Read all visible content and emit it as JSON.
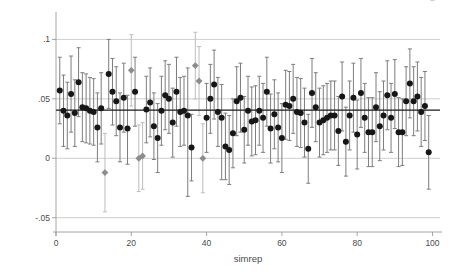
{
  "figure": {
    "background": "#ffffff",
    "plot_area": {
      "left": 56,
      "right": 440,
      "top": 18,
      "bottom": 232
    }
  },
  "chart_data": {
    "type": "scatter",
    "title": "",
    "subtitle": "",
    "xlabel": "simrep",
    "ylabel": "",
    "xlim": [
      0,
      102
    ],
    "ylim": [
      -0.062,
      0.118
    ],
    "xticks": [
      0,
      20,
      40,
      60,
      80,
      100
    ],
    "xtick_labels": [
      "0",
      "20",
      "40",
      "60",
      "80",
      "100"
    ],
    "yticks": [
      -0.05,
      0,
      0.05,
      0.1
    ],
    "ytick_labels": [
      "-.05",
      "0",
      ".05",
      ".1"
    ],
    "grid": {
      "horizontal": true,
      "vertical": false,
      "color": "#b9b9b9"
    },
    "legend": {
      "visible": false,
      "position": "none"
    },
    "reference_line": {
      "value": 0.0405,
      "color": "#1a1a1a",
      "width": 1.1,
      "label": ""
    },
    "marker_styles": {
      "normal": {
        "shape": "circle",
        "color": "#161616",
        "size": 3.0
      },
      "highlight": {
        "shape": "diamond",
        "color": "#8c8c8c",
        "size": 3.4
      }
    },
    "errorbar_style": {
      "color": "#7d7d7d",
      "highlight_color": "#bdbdbd",
      "width": 1.0,
      "cap_width": 4.0
    },
    "n_points": 100,
    "x": [
      1,
      2,
      3,
      4,
      5,
      6,
      7,
      8,
      9,
      10,
      11,
      12,
      13,
      14,
      15,
      16,
      17,
      18,
      19,
      20,
      21,
      22,
      23,
      24,
      25,
      26,
      27,
      28,
      29,
      30,
      31,
      32,
      33,
      34,
      35,
      36,
      37,
      38,
      39,
      40,
      41,
      42,
      43,
      44,
      45,
      46,
      47,
      48,
      49,
      50,
      51,
      52,
      53,
      54,
      55,
      56,
      57,
      58,
      59,
      60,
      61,
      62,
      63,
      64,
      65,
      66,
      67,
      68,
      69,
      70,
      71,
      72,
      73,
      74,
      75,
      76,
      77,
      78,
      79,
      80,
      81,
      82,
      83,
      84,
      85,
      86,
      87,
      88,
      89,
      90,
      91,
      92,
      93,
      94,
      95,
      96,
      97,
      98,
      99,
      100
    ],
    "y": [
      0.057,
      0.04,
      0.036,
      0.054,
      0.038,
      0.064,
      0.043,
      0.042,
      0.04,
      0.039,
      0.026,
      0.042,
      -0.012,
      0.071,
      0.056,
      0.048,
      0.026,
      0.051,
      0.025,
      0.074,
      0.056,
      0.0,
      0.002,
      0.041,
      0.047,
      0.027,
      0.017,
      0.04,
      0.053,
      0.05,
      0.03,
      0.056,
      0.039,
      0.04,
      0.036,
      0.009,
      0.078,
      0.065,
      0.0,
      0.034,
      0.05,
      0.062,
      0.039,
      0.034,
      0.01,
      0.007,
      0.021,
      0.048,
      0.051,
      0.024,
      0.04,
      0.031,
      0.032,
      0.04,
      0.034,
      0.056,
      0.025,
      0.037,
      0.026,
      0.017,
      0.045,
      0.044,
      0.05,
      0.039,
      0.038,
      0.03,
      0.008,
      0.055,
      0.043,
      0.03,
      0.032,
      0.034,
      0.036,
      0.036,
      0.023,
      0.052,
      0.014,
      0.036,
      0.051,
      0.02,
      0.055,
      0.034,
      0.022,
      0.022,
      0.043,
      0.027,
      0.036,
      0.053,
      0.034,
      0.054,
      0.022,
      0.022,
      0.048,
      0.063,
      0.048,
      0.052,
      0.039,
      0.044,
      0.005
    ],
    "y_low": [
      0.029,
      0.01,
      0.008,
      0.022,
      0.01,
      0.035,
      0.014,
      0.013,
      0.012,
      0.011,
      -0.003,
      0.012,
      -0.045,
      0.042,
      0.028,
      0.019,
      -0.003,
      0.022,
      -0.005,
      0.044,
      0.027,
      -0.028,
      -0.026,
      0.013,
      0.018,
      -0.001,
      -0.012,
      0.011,
      0.024,
      0.021,
      0.001,
      0.027,
      0.01,
      0.011,
      -0.032,
      -0.019,
      0.05,
      0.036,
      -0.029,
      0.005,
      0.021,
      0.033,
      0.01,
      -0.018,
      -0.018,
      -0.022,
      -0.008,
      0.019,
      0.022,
      -0.004,
      0.011,
      0.002,
      0.003,
      0.011,
      0.005,
      0.027,
      -0.004,
      0.008,
      -0.003,
      -0.012,
      0.016,
      0.015,
      0.021,
      0.01,
      0.009,
      0.001,
      -0.021,
      0.026,
      0.014,
      0.001,
      0.003,
      0.005,
      0.007,
      0.007,
      -0.006,
      0.023,
      -0.015,
      0.007,
      0.022,
      -0.009,
      0.026,
      0.005,
      -0.007,
      -0.007,
      0.014,
      -0.002,
      0.007,
      0.024,
      0.005,
      0.025,
      -0.007,
      -0.006,
      0.019,
      0.034,
      0.019,
      0.023,
      0.01,
      0.015,
      -0.026
    ],
    "y_high": [
      0.085,
      0.07,
      0.064,
      0.086,
      0.066,
      0.093,
      0.072,
      0.071,
      0.068,
      0.067,
      0.055,
      0.072,
      0.021,
      0.1,
      0.084,
      0.077,
      0.055,
      0.08,
      0.053,
      0.104,
      0.085,
      0.028,
      0.03,
      0.069,
      0.076,
      0.055,
      0.046,
      0.069,
      0.082,
      0.079,
      0.059,
      0.085,
      0.068,
      0.069,
      0.076,
      0.037,
      0.106,
      0.094,
      0.029,
      0.063,
      0.079,
      0.091,
      0.068,
      0.062,
      0.038,
      0.036,
      0.05,
      0.077,
      0.08,
      0.052,
      0.069,
      0.06,
      0.061,
      0.069,
      0.063,
      0.085,
      0.054,
      0.066,
      0.055,
      0.046,
      0.074,
      0.073,
      0.079,
      0.068,
      0.067,
      0.059,
      0.037,
      0.084,
      0.072,
      0.059,
      0.061,
      0.063,
      0.065,
      0.065,
      0.052,
      0.081,
      0.043,
      0.065,
      0.08,
      0.049,
      0.084,
      0.063,
      0.051,
      0.051,
      0.072,
      0.056,
      0.065,
      0.082,
      0.063,
      0.083,
      0.051,
      0.05,
      0.077,
      0.092,
      0.077,
      0.081,
      0.068,
      0.073,
      0.036
    ],
    "highlight": [
      13,
      20,
      22,
      23,
      37,
      38,
      39,
      100
    ],
    "highlight_note": "gray diamond markers with light gray confidence intervals"
  },
  "axis": {
    "x_title": "simrep",
    "y_title": ""
  }
}
